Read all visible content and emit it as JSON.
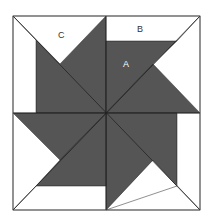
{
  "diagram": {
    "colors": {
      "dark": "#555555",
      "light": "#ffffff",
      "line": "#333333"
    },
    "labels": {
      "A": "A",
      "B": "B",
      "C": "C"
    }
  }
}
